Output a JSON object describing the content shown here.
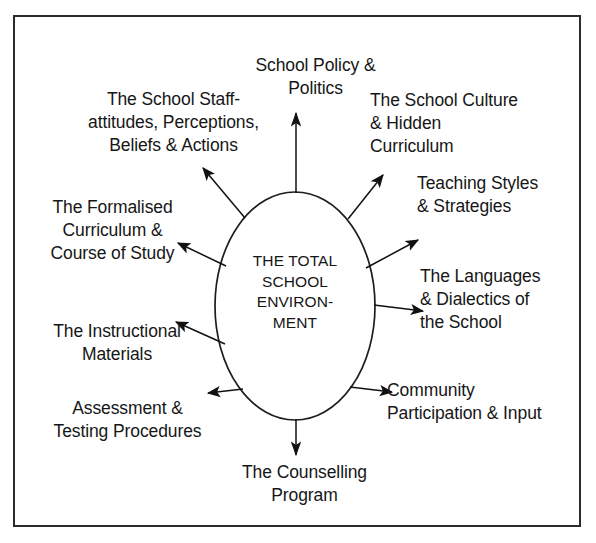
{
  "diagram": {
    "center": {
      "text": "THE TOTAL\nSCHOOL\nENVIRON-\nMENT",
      "shape": "ellipse"
    },
    "colors": {
      "border": "#2b2b2b",
      "text": "#161616",
      "arrow": "#111111",
      "background": "#ffffff"
    },
    "nodes": [
      {
        "id": "policy",
        "text": "School Policy &\nPolitics",
        "direction": "up"
      },
      {
        "id": "staff",
        "text": "The School Staff-\nattitudes, Perceptions,\nBeliefs & Actions",
        "direction": "up-left"
      },
      {
        "id": "culture",
        "text": "The School Culture\n& Hidden\nCurriculum",
        "direction": "up-right"
      },
      {
        "id": "teaching",
        "text": "Teaching Styles\n& Strategies",
        "direction": "right-up"
      },
      {
        "id": "formalised",
        "text": "The Formalised\nCurriculum &\nCourse of Study",
        "direction": "left-up"
      },
      {
        "id": "languages",
        "text": "The Languages\n& Dialectics of\nthe School",
        "direction": "right"
      },
      {
        "id": "instructional",
        "text": "The Instructional\nMaterials",
        "direction": "left-down"
      },
      {
        "id": "community",
        "text": "Community\nParticipation & Input",
        "direction": "down-right"
      },
      {
        "id": "assessment",
        "text": "Assessment &\nTesting Procedures",
        "direction": "down-left"
      },
      {
        "id": "counselling",
        "text": "The Counselling\nProgram",
        "direction": "down"
      }
    ]
  }
}
